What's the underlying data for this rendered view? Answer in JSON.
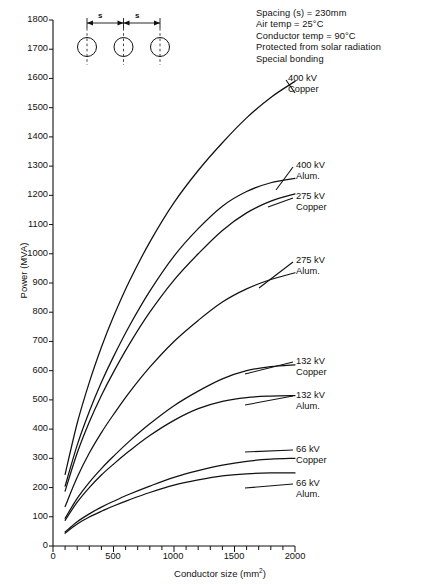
{
  "chart_data": {
    "type": "line",
    "title": "",
    "xlabel": "Conductor size (mm²)",
    "ylabel": "Power (MVA)",
    "xlim": [
      0,
      2000
    ],
    "ylim": [
      0,
      1800
    ],
    "xticks": [
      0,
      500,
      1000,
      1500,
      2000
    ],
    "xminor_step": 100,
    "yticks": [
      0,
      100,
      200,
      300,
      400,
      500,
      600,
      700,
      800,
      900,
      1000,
      1100,
      1200,
      1300,
      1400,
      1500,
      1600,
      1700,
      1800
    ],
    "grid": false,
    "legend_position": "inline-right-labels",
    "x": [
      100,
      200,
      300,
      400,
      500,
      630,
      800,
      1000,
      1200,
      1400,
      1600,
      1800,
      2000
    ],
    "series": [
      {
        "name": "400 kV Copper",
        "label_lines": [
          "400 kV",
          "Copper"
        ],
        "values": [
          245,
          420,
          560,
          680,
          785,
          905,
          1040,
          1175,
          1285,
          1380,
          1465,
          1535,
          1590
        ]
      },
      {
        "name": "400 kV Alum.",
        "label_lines": [
          "400 kV",
          "Alum."
        ],
        "values": [
          205,
          345,
          460,
          560,
          648,
          752,
          872,
          992,
          1086,
          1163,
          1213,
          1243,
          1258
        ]
      },
      {
        "name": "275 kV Copper",
        "label_lines": [
          "275 kV",
          "Copper"
        ],
        "values": [
          188,
          318,
          424,
          515,
          595,
          690,
          800,
          910,
          1000,
          1080,
          1140,
          1180,
          1205
        ]
      },
      {
        "name": "275 kV Alum.",
        "label_lines": [
          "275 kV",
          "Alum."
        ],
        "values": [
          135,
          235,
          318,
          388,
          450,
          525,
          612,
          700,
          772,
          835,
          880,
          912,
          935
        ]
      },
      {
        "name": "132 kV Copper",
        "label_lines": [
          "132 kV",
          "Copper"
        ],
        "values": [
          95,
          163,
          218,
          265,
          307,
          358,
          418,
          480,
          530,
          572,
          600,
          614,
          620
        ]
      },
      {
        "name": "132 kV Alum.",
        "label_lines": [
          "132 kV",
          "Alum."
        ],
        "values": [
          88,
          150,
          200,
          243,
          280,
          325,
          378,
          430,
          470,
          495,
          508,
          513,
          515
        ]
      },
      {
        "name": "66 kV Copper",
        "label_lines": [
          "66 kV",
          "Copper"
        ],
        "values": [
          48,
          83,
          110,
          133,
          153,
          177,
          205,
          235,
          258,
          277,
          290,
          297,
          300
        ]
      },
      {
        "name": "66 kV Alum.",
        "label_lines": [
          "66 kV",
          "Alum."
        ],
        "values": [
          44,
          75,
          99,
          119,
          137,
          158,
          183,
          208,
          226,
          240,
          247,
          250,
          250
        ]
      }
    ],
    "annotations": [
      "Spacing (s) = 230mm",
      "Air temp = 25°C",
      "Conductor temp = 90°C",
      "Protected from solar radiation",
      "Special bonding"
    ],
    "diagram": {
      "name": "three-conductor-flat-formation",
      "spacing_label_left": "s",
      "spacing_label_right": "s",
      "conductor_count": 3
    }
  },
  "axis": {
    "y_tick_labels": [
      "1800",
      "1700",
      "1600",
      "1500",
      "1400",
      "1300",
      "1200",
      "1100",
      "1000",
      "900",
      "800",
      "700",
      "600",
      "500",
      "400",
      "300",
      "200",
      "100",
      "0"
    ],
    "x_tick_labels": [
      "0",
      "500",
      "1000",
      "1500",
      "2000"
    ],
    "ylabel": "Power (MVA)",
    "xlabel_main": "Conductor size (mm",
    "xlabel_sup": "2",
    "xlabel_close": ")"
  }
}
